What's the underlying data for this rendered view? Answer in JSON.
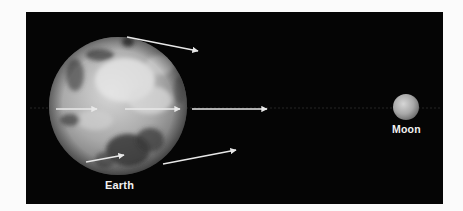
{
  "diagram": {
    "background_color": "#050505",
    "page_color": "#fbfbfb",
    "bodies": {
      "earth": {
        "label": "Earth",
        "cx": 118,
        "cy": 106,
        "r": 69
      },
      "moon": {
        "label": "Moon",
        "cx": 406,
        "cy": 107,
        "r": 13
      }
    },
    "axis_line": {
      "x1": 30,
      "y1": 108,
      "x2": 440,
      "y2": 108
    },
    "arrows": [
      {
        "id": "top-outer",
        "x1": 127,
        "y1": 37,
        "x2": 198,
        "y2": 51
      },
      {
        "id": "middle-inner-left",
        "x1": 56,
        "y1": 109,
        "x2": 97,
        "y2": 109
      },
      {
        "id": "middle-inner-right",
        "x1": 125,
        "y1": 109,
        "x2": 180,
        "y2": 109
      },
      {
        "id": "middle-outer",
        "x1": 192,
        "y1": 109,
        "x2": 267,
        "y2": 109
      },
      {
        "id": "bottom-inner",
        "x1": 86,
        "y1": 162,
        "x2": 124,
        "y2": 155
      },
      {
        "id": "bottom-outer",
        "x1": 163,
        "y1": 164,
        "x2": 236,
        "y2": 150
      }
    ],
    "arrow_color": "#e8e8e8"
  }
}
